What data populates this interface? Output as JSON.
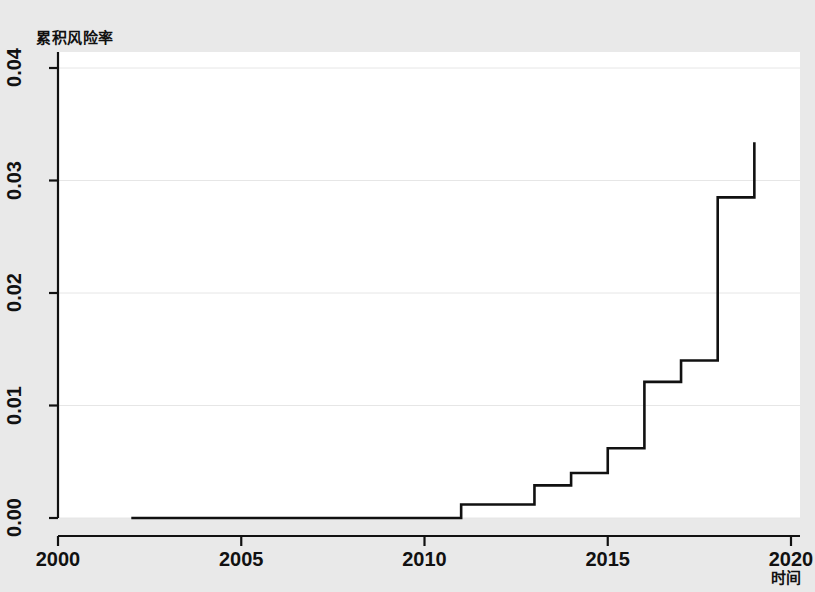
{
  "chart_data": {
    "type": "line",
    "subtype": "step",
    "title": "累积风险率",
    "xlabel": "时间",
    "ylabel": "累积风险率",
    "xlim": [
      2000,
      2020
    ],
    "ylim": [
      0.0,
      0.04
    ],
    "xticks": [
      "2000",
      "2005",
      "2010",
      "2015",
      "2020"
    ],
    "xtick_values": [
      2000,
      2005,
      2010,
      2015,
      2020
    ],
    "yticks": [
      "0.00",
      "0.01",
      "0.02",
      "0.03",
      "0.04"
    ],
    "ytick_values": [
      0.0,
      0.01,
      0.02,
      0.03,
      0.04
    ],
    "grid": "horizontal",
    "legend": "none",
    "line_color": "#111111",
    "line_width": 2.6,
    "plot_bg": "#ffffff",
    "figure_bg": "#e9e9e9",
    "grid_color": "#e6e6e6",
    "series": [
      {
        "name": "累积风险率",
        "x": [
          2002.0,
          2011.0,
          2011.0,
          2013.0,
          2013.0,
          2014.0,
          2014.0,
          2015.0,
          2015.0,
          2016.0,
          2016.0,
          2017.0,
          2017.0,
          2018.0,
          2018.0,
          2019.0,
          2019.0
        ],
        "y": [
          0.0,
          0.0,
          0.0012,
          0.0012,
          0.0029,
          0.0029,
          0.004,
          0.004,
          0.0062,
          0.0062,
          0.0121,
          0.0121,
          0.014,
          0.014,
          0.0285,
          0.0285,
          0.0334
        ]
      }
    ],
    "steps": [
      {
        "year": 2002.0,
        "value": 0.0
      },
      {
        "year": 2011.0,
        "value": 0.0012
      },
      {
        "year": 2013.0,
        "value": 0.0029
      },
      {
        "year": 2014.0,
        "value": 0.004
      },
      {
        "year": 2015.0,
        "value": 0.0062
      },
      {
        "year": 2016.0,
        "value": 0.0121
      },
      {
        "year": 2017.0,
        "value": 0.014
      },
      {
        "year": 2018.0,
        "value": 0.0285
      },
      {
        "year": 2019.0,
        "value": 0.0334
      }
    ]
  }
}
